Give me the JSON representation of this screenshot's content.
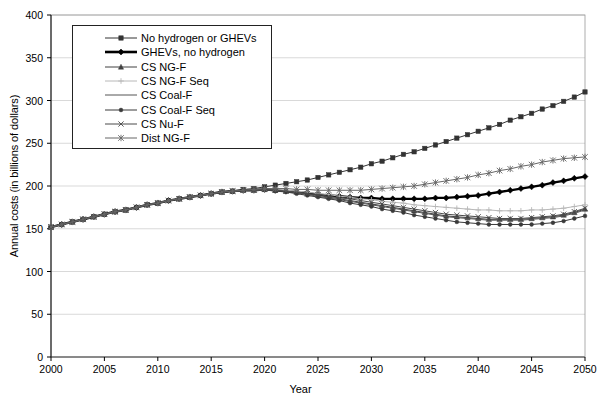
{
  "chart_data": {
    "type": "line",
    "title": "",
    "xlabel": "Year",
    "ylabel": "Annual costs (in billions of dollars)",
    "xlim": [
      2000,
      2050
    ],
    "ylim": [
      0,
      400
    ],
    "xticks": [
      "2000",
      "2005",
      "2010",
      "2015",
      "2020",
      "2025",
      "2030",
      "2035",
      "2040",
      "2045",
      "2050"
    ],
    "yticks": [
      "0",
      "50",
      "100",
      "150",
      "200",
      "250",
      "300",
      "350",
      "400"
    ],
    "grid": true,
    "legend_position": "upper-left-inside",
    "x": [
      2000,
      2001,
      2002,
      2003,
      2004,
      2005,
      2006,
      2007,
      2008,
      2009,
      2010,
      2011,
      2012,
      2013,
      2014,
      2015,
      2016,
      2017,
      2018,
      2019,
      2020,
      2021,
      2022,
      2023,
      2024,
      2025,
      2026,
      2027,
      2028,
      2029,
      2030,
      2031,
      2032,
      2033,
      2034,
      2035,
      2036,
      2037,
      2038,
      2039,
      2040,
      2041,
      2042,
      2043,
      2044,
      2045,
      2046,
      2047,
      2048,
      2049,
      2050
    ],
    "series": [
      {
        "name": "No hydrogen or GHEVs",
        "marker": "square",
        "color": "#333333",
        "values": [
          152,
          155,
          158,
          161,
          164,
          167,
          170,
          172,
          175,
          178,
          180,
          183,
          185,
          187,
          189,
          191,
          193,
          194,
          196,
          197,
          199,
          201,
          203,
          205,
          207,
          210,
          213,
          216,
          219,
          222,
          226,
          229,
          233,
          237,
          240,
          244,
          248,
          252,
          256,
          260,
          264,
          268,
          272,
          277,
          281,
          285,
          290,
          294,
          299,
          304,
          310
        ]
      },
      {
        "name": "GHEVs, no hydrogen",
        "marker": "diamond",
        "color": "#000000",
        "values": [
          152,
          155,
          158,
          161,
          164,
          167,
          170,
          172,
          175,
          178,
          180,
          183,
          185,
          187,
          189,
          191,
          193,
          194,
          195,
          195,
          196,
          195,
          194,
          193,
          192,
          190,
          189,
          188,
          187,
          186,
          186,
          185,
          185,
          185,
          185,
          185,
          186,
          186,
          187,
          188,
          189,
          191,
          193,
          195,
          197,
          199,
          201,
          204,
          206,
          209,
          211
        ]
      },
      {
        "name": "CS NG-F",
        "marker": "triangle",
        "color": "#404040",
        "values": [
          152,
          155,
          158,
          161,
          164,
          167,
          170,
          172,
          175,
          178,
          180,
          183,
          185,
          187,
          189,
          191,
          193,
          194,
          195,
          195,
          196,
          195,
          194,
          193,
          191,
          189,
          187,
          185,
          183,
          181,
          179,
          177,
          175,
          173,
          171,
          169,
          167,
          165,
          164,
          163,
          162,
          161,
          161,
          161,
          161,
          162,
          163,
          164,
          166,
          169,
          173
        ]
      },
      {
        "name": "CS NG-F Seq",
        "marker": "plus",
        "color": "#b8b8b8",
        "values": [
          152,
          155,
          158,
          161,
          164,
          167,
          170,
          172,
          175,
          178,
          180,
          183,
          185,
          187,
          189,
          191,
          193,
          194,
          195,
          195,
          196,
          195,
          195,
          194,
          193,
          191,
          190,
          188,
          187,
          185,
          184,
          182,
          181,
          180,
          178,
          177,
          176,
          175,
          174,
          173,
          172,
          172,
          171,
          171,
          171,
          172,
          172,
          173,
          174,
          176,
          178
        ]
      },
      {
        "name": "CS Coal-F",
        "marker": "none",
        "color": "#555555",
        "values": [
          152,
          155,
          158,
          161,
          164,
          167,
          170,
          172,
          175,
          178,
          180,
          183,
          185,
          187,
          189,
          191,
          193,
          194,
          195,
          195,
          196,
          195,
          194,
          192,
          190,
          188,
          186,
          184,
          182,
          180,
          178,
          176,
          174,
          172,
          170,
          168,
          166,
          164,
          163,
          162,
          161,
          160,
          160,
          160,
          160,
          161,
          162,
          163,
          165,
          168,
          172
        ]
      },
      {
        "name": "CS Coal-F Seq",
        "marker": "dot",
        "color": "#3a3a3a",
        "values": [
          152,
          155,
          158,
          161,
          164,
          167,
          170,
          172,
          175,
          178,
          180,
          183,
          185,
          187,
          189,
          191,
          193,
          194,
          195,
          195,
          196,
          194,
          193,
          191,
          189,
          187,
          185,
          183,
          180,
          178,
          176,
          173,
          171,
          169,
          166,
          164,
          162,
          160,
          158,
          157,
          156,
          155,
          155,
          155,
          155,
          155,
          156,
          157,
          159,
          162,
          165
        ]
      },
      {
        "name": "CS Nu-F",
        "marker": "x",
        "color": "#4a4a4a",
        "values": [
          152,
          155,
          158,
          161,
          164,
          167,
          170,
          172,
          175,
          178,
          180,
          183,
          185,
          187,
          189,
          191,
          193,
          194,
          195,
          195,
          196,
          195,
          194,
          193,
          191,
          190,
          188,
          186,
          185,
          183,
          181,
          179,
          177,
          175,
          173,
          171,
          169,
          167,
          166,
          165,
          164,
          163,
          162,
          162,
          162,
          163,
          164,
          165,
          167,
          170,
          174
        ]
      },
      {
        "name": "Dist NG-F",
        "marker": "star",
        "color": "#666666",
        "values": [
          152,
          155,
          158,
          161,
          164,
          167,
          170,
          172,
          175,
          178,
          180,
          183,
          185,
          187,
          189,
          191,
          193,
          194,
          195,
          196,
          197,
          197,
          197,
          196,
          196,
          195,
          195,
          195,
          195,
          195,
          196,
          197,
          198,
          199,
          200,
          202,
          204,
          206,
          208,
          210,
          213,
          215,
          218,
          220,
          223,
          225,
          228,
          230,
          232,
          233,
          234
        ]
      }
    ]
  },
  "legend": {
    "items": [
      {
        "label": "No hydrogen or GHEVs"
      },
      {
        "label": "GHEVs, no hydrogen"
      },
      {
        "label": "CS NG-F"
      },
      {
        "label": "CS NG-F Seq"
      },
      {
        "label": "CS Coal-F"
      },
      {
        "label": "CS Coal-F Seq"
      },
      {
        "label": "CS Nu-F"
      },
      {
        "label": "Dist NG-F"
      }
    ]
  }
}
